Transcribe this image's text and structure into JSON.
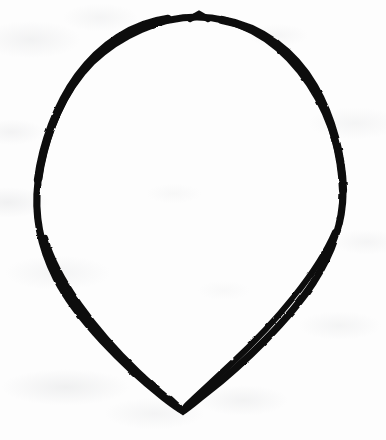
{
  "canvas": {
    "width": 386,
    "height": 440,
    "background_color": "#fdfdfd",
    "medium": "scanned paper",
    "title": "Hand-drawn leaf outline"
  },
  "drawing": {
    "subject": "leaf-outline",
    "description": "Single closed hand-drawn outline of a leaf / teardrop shape: broad rounded dome at the top, widest across the middle, tapering to a sharp V point at the bottom.",
    "stroke_color": "#111111",
    "stroke_width": 7,
    "fill_color": "none",
    "closed": true,
    "key_points": {
      "apex_top": {
        "x": 197,
        "y": 17
      },
      "left_extreme": {
        "x": 38,
        "y": 200
      },
      "right_extreme": {
        "x": 342,
        "y": 192
      },
      "bottom_vertex": {
        "x": 183,
        "y": 411
      }
    },
    "outline_path": "M 197 17 C 160 17 120 35 92 62 C 64 90 44 135 38 182 C 34 214 40 246 56 278 C 76 318 124 366 163 397 C 172 404 179 409 183 411 C 188 408 196 401 205 394 C 246 362 290 318 313 283 C 333 252 343 222 343 192 C 343 150 327 105 300 71 C 272 36 236 17 197 17 Z",
    "ink_texture": {
      "apex_kink": {
        "x": 199,
        "y": 16,
        "note": "small angular notch where two strokes meet at the top"
      },
      "thickest_segment": "upper-left shoulder",
      "thinnest_segment": "lower-right taper"
    }
  },
  "paper": {
    "tone": "#fdfdfd",
    "smudge_color": "#a8aaaf",
    "smudge_regions": [
      "top-left",
      "left-middle",
      "bottom-left",
      "bottom-center",
      "right-middle"
    ]
  }
}
